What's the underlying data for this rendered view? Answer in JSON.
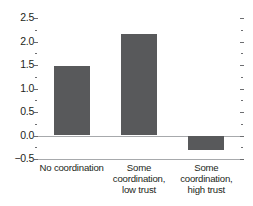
{
  "chart_data": {
    "type": "bar",
    "title": "",
    "subtitle": "",
    "xlabel": "",
    "ylabel": "",
    "categories": [
      "No coordination",
      "Some coordination, low trust",
      "Some coordination, high trust"
    ],
    "category_lines": [
      [
        "No coordination"
      ],
      [
        "Some",
        "coordination,",
        "low trust"
      ],
      [
        "Some",
        "coordination,",
        "high trust"
      ]
    ],
    "values": [
      1.47,
      2.15,
      -0.3
    ],
    "ylim": [
      -0.5,
      2.5
    ],
    "ytick_labels": [
      "2.5",
      "2.0",
      "1.5",
      "1.0",
      "0.5",
      "0.0",
      "−0.5"
    ],
    "ytick_values": [
      2.5,
      2.0,
      1.5,
      1.0,
      0.5,
      0.0,
      -0.5
    ],
    "yminor_values": [
      2.25,
      1.75,
      1.25,
      0.75,
      0.25,
      -0.25
    ],
    "grid": false,
    "legend": null,
    "bar_color": "#58595b",
    "axis_color": "#a7a9ac",
    "tick_color": "#6d6e71",
    "text_color": "#231f20",
    "background": "#ffffff"
  }
}
